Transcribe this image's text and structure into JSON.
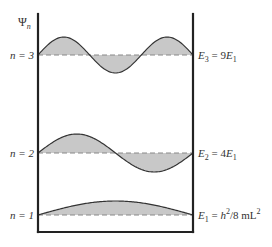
{
  "axis_label": {
    "symbol": "Ψ",
    "subscript": "n"
  },
  "colors": {
    "fill": "#c8c8c8",
    "stroke": "#333333",
    "wall": "#222222",
    "dashed": "#888888"
  },
  "box": {
    "left_x": 38,
    "right_x": 193,
    "top_y": 14,
    "bottom_y": 232
  },
  "levels": [
    {
      "n": 3,
      "left_label": "n = 3",
      "energy_label": {
        "E": "E",
        "sub": "3",
        "rest": " = 9",
        "E2": "E",
        "sub2": "1"
      },
      "y": 55,
      "amplitude": 18
    },
    {
      "n": 2,
      "left_label": "n = 2",
      "energy_label": {
        "E": "E",
        "sub": "2",
        "rest": " = 4",
        "E2": "E",
        "sub2": "1"
      },
      "y": 153,
      "amplitude": 19
    },
    {
      "n": 1,
      "left_label": "n = 1",
      "energy_label": {
        "E": "E",
        "sub": "1",
        "rest": " = ",
        "h": "h",
        "sup": "2",
        "tail": "/8 mL",
        "sup2": "2"
      },
      "y": 215,
      "amplitude": 14
    }
  ]
}
